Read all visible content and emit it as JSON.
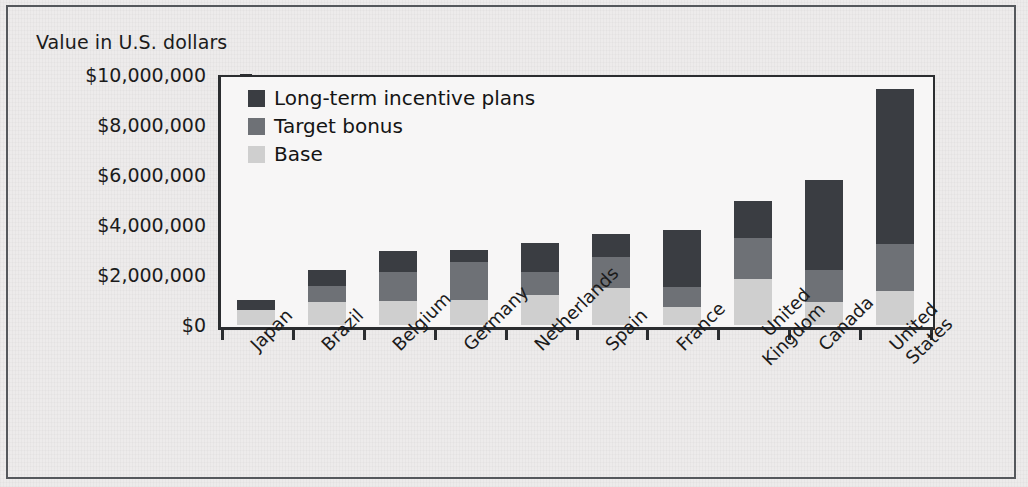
{
  "figure": {
    "axis_title": "Value in U.S. dollars"
  },
  "legend": {
    "position": "inside-top-left",
    "items": [
      {
        "label": "Long-term incentive plans",
        "color": "#3a3d42",
        "swatch_name": "legend-swatch-lti"
      },
      {
        "label": "Target bonus",
        "color": "#6e7176",
        "swatch_name": "legend-swatch-bonus"
      },
      {
        "label": "Base",
        "color": "#cfcfcf",
        "swatch_name": "legend-swatch-base"
      }
    ]
  },
  "chart_data": {
    "type": "bar",
    "stacked": true,
    "title": "",
    "subtitle": "",
    "xlabel": "",
    "ylabel": "Value in U.S. dollars",
    "ylim": [
      0,
      10000000
    ],
    "ytick_labels": [
      "$10,000,000",
      "$8,000,000",
      "$6,000,000",
      "$4,000,000",
      "$2,000,000",
      "$0"
    ],
    "ytick_values": [
      10000000,
      8000000,
      6000000,
      4000000,
      2000000,
      0
    ],
    "grid": false,
    "legend_position": "inside-top-left",
    "categories": [
      "Japan",
      "Brazil",
      "Belgium",
      "Germany",
      "Netherlands",
      "Spain",
      "France",
      "United Kingdom",
      "Canada",
      "United States"
    ],
    "series": [
      {
        "name": "Base",
        "color": "#cfcfcf",
        "values": [
          600000,
          920000,
          960000,
          1000000,
          1200000,
          1480000,
          720000,
          1840000,
          920000,
          1360000
        ]
      },
      {
        "name": "Target bonus",
        "color": "#6e7176",
        "values": [
          0,
          640000,
          1180000,
          1520000,
          920000,
          1240000,
          800000,
          1660000,
          1280000,
          1880000
        ]
      },
      {
        "name": "Long-term incentive plans",
        "color": "#3a3d42",
        "values": [
          400000,
          640000,
          820000,
          480000,
          1180000,
          940000,
          2280000,
          1460000,
          3600000,
          6220000
        ]
      }
    ],
    "totals": [
      1000000,
      2200000,
      2960000,
      3000000,
      3300000,
      3660000,
      3800000,
      4960000,
      5800000,
      9460000
    ]
  },
  "colors": {
    "frame": "#55585c",
    "axis": "#2b2d30",
    "background": "#edebeb",
    "plot_background": "#f7f6f6",
    "text": "#1b1b1b"
  }
}
